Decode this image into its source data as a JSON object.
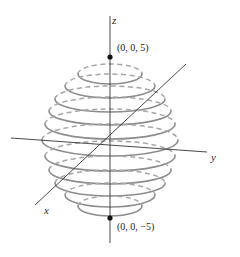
{
  "figure": {
    "background_color": "#ffffff",
    "width": 240,
    "height": 257
  },
  "colors": {
    "ring_stroke": "#8c8c8c",
    "ring_dashed_stroke": "#a6a6a6",
    "axis_stroke": "#333333",
    "point_fill": "#111111",
    "label_text": "#1a1a1a"
  },
  "axes": {
    "z": {
      "label": "z",
      "label_x": 112,
      "label_y": 24,
      "x1": 110,
      "y1": 16,
      "x2": 110,
      "y2": 243
    },
    "y": {
      "label": "y",
      "label_x": 211,
      "label_y": 161,
      "x1": 11,
      "y1": 138,
      "x2": 207,
      "y2": 152
    },
    "x": {
      "label": "x",
      "label_x": 44,
      "label_y": 214,
      "x1": 186,
      "y1": 64,
      "x2": 35,
      "y2": 205
    }
  },
  "origin": {
    "x": 110,
    "y": 145
  },
  "points": [
    {
      "name": "north-pole",
      "label": "(0, 0, 5)",
      "cx": 110,
      "cy": 57,
      "label_x": 117,
      "label_y": 51
    },
    {
      "name": "south-pole",
      "label": "(0, 0, −5)",
      "cx": 110,
      "cy": 218,
      "label_x": 117,
      "label_y": 230
    }
  ],
  "chart_data": {
    "type": "line",
    "xlabel": "y",
    "ylabel": "z",
    "zlabel": "x",
    "grid": false,
    "legend": null,
    "sphere_radius": 5,
    "center": [
      0,
      0,
      0
    ],
    "axis_extents": {
      "z": [
        -5,
        5
      ],
      "y": [
        -5,
        5
      ],
      "x": [
        -5,
        5
      ]
    },
    "labeled_points": [
      {
        "coords": [
          0,
          0,
          5
        ],
        "label": "(0, 0, 5)"
      },
      {
        "coords": [
          0,
          0,
          -5
        ],
        "label": "(0, 0, −5)"
      }
    ],
    "cross_sections": [
      {
        "z": 4.4,
        "radius": 2.37,
        "cx": 110,
        "cy": 74,
        "rx": 32,
        "ry": 10
      },
      {
        "z": 3.7,
        "radius": 3.36,
        "cx": 110,
        "cy": 86,
        "rx": 45,
        "ry": 12
      },
      {
        "z": 2.9,
        "radius": 4.07,
        "cx": 110,
        "cy": 99,
        "rx": 55,
        "ry": 13
      },
      {
        "z": 2.1,
        "radius": 4.54,
        "cx": 110,
        "cy": 111,
        "rx": 61,
        "ry": 14
      },
      {
        "z": 1.2,
        "radius": 4.85,
        "cx": 110,
        "cy": 124,
        "rx": 65,
        "ry": 15
      },
      {
        "z": 0.0,
        "radius": 5.0,
        "cx": 110,
        "cy": 140,
        "rx": 68,
        "ry": 16
      },
      {
        "z": -1.2,
        "radius": 4.85,
        "cx": 110,
        "cy": 156,
        "rx": 65,
        "ry": 15
      },
      {
        "z": -2.1,
        "radius": 4.54,
        "cx": 110,
        "cy": 170,
        "rx": 61,
        "ry": 14
      },
      {
        "z": -2.9,
        "radius": 4.07,
        "cx": 110,
        "cy": 183,
        "rx": 55,
        "ry": 13
      },
      {
        "z": -3.7,
        "radius": 3.36,
        "cx": 110,
        "cy": 195,
        "rx": 45,
        "ry": 12
      },
      {
        "z": -4.4,
        "radius": 2.37,
        "cx": 110,
        "cy": 206,
        "rx": 32,
        "ry": 10
      }
    ]
  }
}
